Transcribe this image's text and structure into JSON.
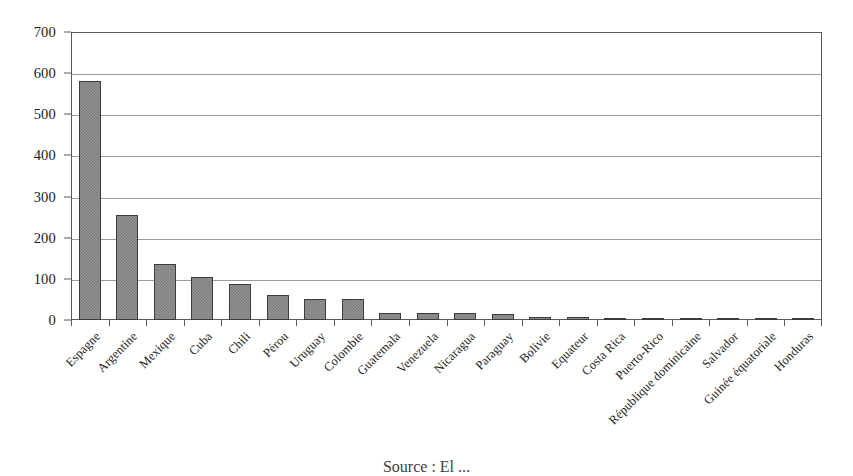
{
  "chart_data": {
    "type": "bar",
    "title": "",
    "subtitle": "",
    "xlabel": "",
    "ylabel": "",
    "ylim": [
      0,
      700
    ],
    "ytick_step": 100,
    "yticks": [
      0,
      100,
      200,
      300,
      400,
      500,
      600,
      700
    ],
    "grid": true,
    "legend": false,
    "legend_position": "none",
    "bar_color": "#7b7b7b",
    "bar_edge_color": "#3c3c3c",
    "categories": [
      "Espagne",
      "Argentine",
      "Mexique",
      "Cuba",
      "Chili",
      "Pérou",
      "Uruguay",
      "Colombie",
      "Guatemala",
      "Venezuela",
      "Nicaragua",
      "Paraguay",
      "Bolivie",
      "Equateur",
      "Costa Rica",
      "Puerto-Rico",
      "République dominicaine",
      "Salvador",
      "Guinée équatoriale",
      "Honduras"
    ],
    "values": [
      582,
      255,
      137,
      104,
      88,
      60,
      52,
      50,
      18,
      17,
      17,
      14,
      8,
      7,
      6,
      5,
      6,
      6,
      2,
      1
    ]
  },
  "caption": {
    "source_text": "Source : El ..."
  },
  "colors": {
    "background": "#ffffff",
    "axis": "#5a5a5a",
    "gridline": "#9a9a9a",
    "text": "#1a1a1a"
  }
}
